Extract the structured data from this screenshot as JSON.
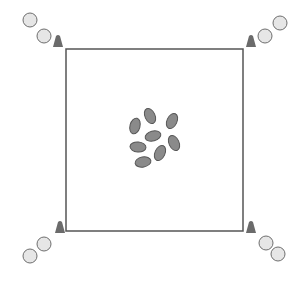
{
  "diagram": {
    "title": "",
    "colors": {
      "background": "#ffffff",
      "square_stroke": "#555555",
      "cone_fill": "#6b6b6b",
      "circle_fill": "#e6e6e6",
      "circle_stroke": "#6e6e6e",
      "seed_fill": "#8a8a8a",
      "seed_stroke": "#555555"
    },
    "square": {
      "x": 66,
      "y": 49,
      "width": 177,
      "height": 182
    },
    "corners": [
      {
        "name": "top-left",
        "cone": {
          "x": 58,
          "y": 47
        },
        "circles": [
          {
            "cx": 44,
            "cy": 36
          },
          {
            "cx": 30,
            "cy": 20
          }
        ]
      },
      {
        "name": "top-right",
        "cone": {
          "x": 251,
          "y": 47
        },
        "circles": [
          {
            "cx": 265,
            "cy": 36
          },
          {
            "cx": 280,
            "cy": 23
          }
        ]
      },
      {
        "name": "bottom-left",
        "cone": {
          "x": 60,
          "y": 233
        },
        "circles": [
          {
            "cx": 44,
            "cy": 244
          },
          {
            "cx": 30,
            "cy": 256
          }
        ]
      },
      {
        "name": "bottom-right",
        "cone": {
          "x": 251,
          "y": 233
        },
        "circles": [
          {
            "cx": 266,
            "cy": 243
          },
          {
            "cx": 278,
            "cy": 254
          }
        ]
      }
    ],
    "seeds": [
      {
        "cx": 150,
        "cy": 116,
        "rx": 5,
        "ry": 8,
        "rot": -25
      },
      {
        "cx": 172,
        "cy": 121,
        "rx": 5,
        "ry": 8,
        "rot": 25
      },
      {
        "cx": 135,
        "cy": 126,
        "rx": 5,
        "ry": 8,
        "rot": 15
      },
      {
        "cx": 153,
        "cy": 136,
        "rx": 5,
        "ry": 8,
        "rot": 75
      },
      {
        "cx": 138,
        "cy": 147,
        "rx": 5,
        "ry": 8,
        "rot": 95
      },
      {
        "cx": 174,
        "cy": 143,
        "rx": 5,
        "ry": 8,
        "rot": -25
      },
      {
        "cx": 160,
        "cy": 153,
        "rx": 5,
        "ry": 8,
        "rot": 25
      },
      {
        "cx": 143,
        "cy": 162,
        "rx": 5,
        "ry": 8,
        "rot": 80
      }
    ]
  }
}
